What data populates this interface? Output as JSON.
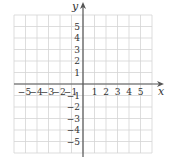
{
  "chart_data": {
    "type": "scatter",
    "title": "",
    "xlabel": "x",
    "ylabel": "y",
    "xlim": [
      -6,
      6
    ],
    "ylim": [
      -6,
      6
    ],
    "grid": true,
    "x_tick_labels": [
      "−5",
      "−4",
      "−3",
      "−2",
      "−1",
      "1",
      "2",
      "3",
      "4",
      "5"
    ],
    "x_tick_values": [
      -5,
      -4,
      -3,
      -2,
      -1,
      1,
      2,
      3,
      4,
      5
    ],
    "y_tick_labels": [
      "5",
      "4",
      "3",
      "2",
      "1",
      "−1",
      "−2",
      "−3",
      "−4",
      "−5"
    ],
    "y_tick_values": [
      5,
      4,
      3,
      2,
      1,
      -1,
      -2,
      -3,
      -4,
      -5
    ],
    "series": [],
    "legend": null
  },
  "plane": {
    "x_axis_label": "x",
    "y_axis_label": "y",
    "colors": {
      "grid": "#d4d4d4",
      "axis": "#555555",
      "text": "#333333"
    }
  }
}
